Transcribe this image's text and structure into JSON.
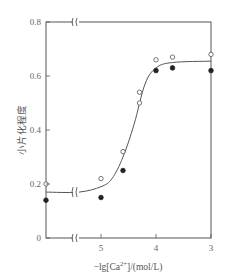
{
  "chart_data": {
    "type": "scatter",
    "title": "",
    "xlabel": "-lg[Ca2+]/(mol/L)",
    "ylabel": "小片化程度",
    "x_reversed": true,
    "x_axis_break": true,
    "y_axis_break_at_top": true,
    "xlim": [
      6.0,
      3.0
    ],
    "ylim": [
      0,
      0.8
    ],
    "x_ticks": [
      {
        "value": 5,
        "label": "5"
      },
      {
        "value": 4,
        "label": "4"
      },
      {
        "value": 3,
        "label": "3"
      }
    ],
    "y_ticks": [
      {
        "value": 0,
        "label": "0"
      },
      {
        "value": 0.2,
        "label": "0.2"
      },
      {
        "value": 0.4,
        "label": "0.4"
      },
      {
        "value": 0.6,
        "label": "0.6"
      },
      {
        "value": 0.8,
        "label": "0.8"
      }
    ],
    "grid": false,
    "legend": null,
    "series": [
      {
        "name": "open circles",
        "marker": "open-circle",
        "points": [
          {
            "x": 6.0,
            "y": 0.2
          },
          {
            "x": 5.0,
            "y": 0.22
          },
          {
            "x": 4.6,
            "y": 0.32
          },
          {
            "x": 4.3,
            "y": 0.54
          },
          {
            "x": 4.3,
            "y": 0.5
          },
          {
            "x": 4.0,
            "y": 0.66
          },
          {
            "x": 3.7,
            "y": 0.67
          },
          {
            "x": 3.0,
            "y": 0.68
          }
        ]
      },
      {
        "name": "filled circles",
        "marker": "filled-circle",
        "points": [
          {
            "x": 6.0,
            "y": 0.14
          },
          {
            "x": 5.0,
            "y": 0.15
          },
          {
            "x": 4.6,
            "y": 0.25
          },
          {
            "x": 4.0,
            "y": 0.62
          },
          {
            "x": 3.7,
            "y": 0.63
          },
          {
            "x": 3.0,
            "y": 0.62
          }
        ]
      },
      {
        "name": "fitted curve",
        "marker": "line",
        "points": [
          {
            "x": 6.0,
            "y": 0.17
          },
          {
            "x": 5.4,
            "y": 0.17
          },
          {
            "x": 5.0,
            "y": 0.19
          },
          {
            "x": 4.8,
            "y": 0.22
          },
          {
            "x": 4.6,
            "y": 0.3
          },
          {
            "x": 4.4,
            "y": 0.42
          },
          {
            "x": 4.2,
            "y": 0.57
          },
          {
            "x": 4.0,
            "y": 0.63
          },
          {
            "x": 3.7,
            "y": 0.65
          },
          {
            "x": 3.0,
            "y": 0.655
          }
        ]
      }
    ]
  }
}
